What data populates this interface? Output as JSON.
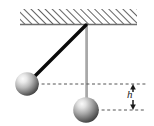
{
  "figure": {
    "labels": {
      "height": "h"
    },
    "colors": {
      "rod": "#0a0a0a",
      "vertical_rod": "#8a8a8a",
      "ceiling_hatch": "#3c3c3c",
      "ceiling_line": "#6e6e6e",
      "dashed_line": "#555555",
      "ball_light": "#f2f2f2",
      "ball_dark": "#4a4a4a",
      "background": "#ffffff"
    },
    "geometry": {
      "pivot": {
        "x": 86,
        "y": 25
      },
      "swung_bob": {
        "cx": 27,
        "cy": 84,
        "r": 12
      },
      "rest_bob": {
        "cx": 86,
        "cy": 110,
        "r": 13
      },
      "ceiling": {
        "x1": 20,
        "x2": 137,
        "y": 25,
        "hatch_height": 16
      },
      "upper_dashed_y": 84,
      "lower_dashed_y": 110,
      "dimension_x": 133
    }
  }
}
